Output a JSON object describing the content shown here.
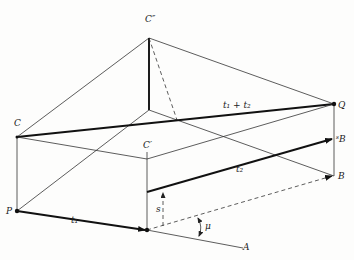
{
  "diagram": {
    "type": "3d-geometric-construction",
    "labels": {
      "c_double_prime": "C″",
      "c": "C",
      "c_prime": "C′",
      "q": "Q",
      "p": "P",
      "s_b": "ˢB",
      "b": "B",
      "a": "A",
      "t1": "t₁",
      "t2": "t₂",
      "t1_plus_t2": "t₁ + t₂",
      "s": "s",
      "mu": "μ"
    },
    "points": {
      "C_double_prime": [
        149,
        38
      ],
      "inner_top": [
        149,
        110
      ],
      "C": [
        17,
        137
      ],
      "Q": [
        334,
        104
      ],
      "P": [
        17,
        211
      ],
      "C_prime_top": [
        147,
        159
      ],
      "lower_vertex": [
        147,
        230
      ],
      "sB": [
        334,
        139
      ],
      "B": [
        334,
        176
      ],
      "A": [
        243,
        248
      ]
    },
    "colors": {
      "ink": "#111111",
      "paper": "#fdfdfc"
    }
  }
}
